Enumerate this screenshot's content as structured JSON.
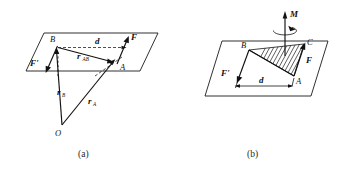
{
  "figure": {
    "background_color": "#ffffff",
    "ink_color": "#111111",
    "panels": [
      {
        "id": "a",
        "caption": "(a)",
        "description": "Couple in a plane with position vectors from origin O",
        "labels": {
          "point_B": "B",
          "point_A": "A",
          "point_O": "O",
          "force_F": "F",
          "force_F_prime": "F'",
          "distance_d": "d",
          "vector_rAB_base": "r",
          "vector_rAB_sub": "AB",
          "vector_rB_base": "r",
          "vector_rB_sub": "B",
          "vector_rA_base": "r",
          "vector_rA_sub": "A"
        }
      },
      {
        "id": "b",
        "caption": "(b)",
        "description": "Couple moment M shown as free vector normal to the plane with hatched area",
        "labels": {
          "point_B": "B",
          "point_A": "A",
          "point_C": "C",
          "moment_M": "M",
          "force_F": "F",
          "force_F_prime": "F'",
          "distance_d": "d"
        }
      }
    ]
  }
}
